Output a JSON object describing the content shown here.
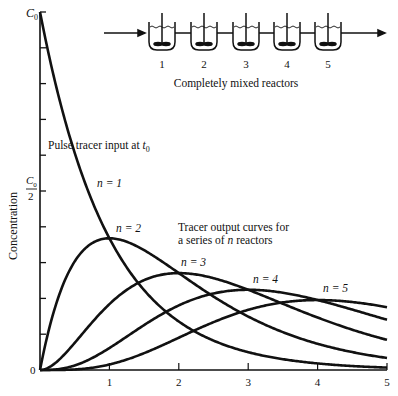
{
  "chart_data": {
    "type": "line",
    "title": "",
    "xlabel": "",
    "ylabel": "Concentration",
    "xlim": [
      0,
      5
    ],
    "ylim": [
      0,
      1
    ],
    "x_ticks": [
      "1",
      "2",
      "3",
      "4",
      "5"
    ],
    "x_origin_label": "0",
    "y_tick_labels": {
      "top": "C0",
      "middle": "C0/2",
      "origin": "0"
    },
    "y_minor_ticks": 10,
    "grid": false,
    "legend": null,
    "formula": "C/C0 = t^(n-1)/(n-1)! * exp(-t)",
    "series": [
      {
        "name": "n = 1",
        "n": 1,
        "peak": {
          "x": 0,
          "y": 1.0
        }
      },
      {
        "name": "n = 2",
        "n": 2,
        "peak": {
          "x": 1,
          "y": 0.368
        }
      },
      {
        "name": "n = 3",
        "n": 3,
        "peak": {
          "x": 2,
          "y": 0.271
        }
      },
      {
        "name": "n = 4",
        "n": 4,
        "peak": {
          "x": 3,
          "y": 0.224
        }
      },
      {
        "name": "n = 5",
        "n": 5,
        "peak": {
          "x": 4,
          "y": 0.195
        }
      }
    ],
    "annotations": [
      "Pulse tracer input at t0",
      "Tracer output curves for",
      "a series of n reactors"
    ]
  },
  "diagram": {
    "reactor_labels": [
      "1",
      "2",
      "3",
      "4",
      "5"
    ],
    "caption": "Completely mixed reactors"
  },
  "labels": {
    "pulse": "Pulse tracer input at ",
    "pulse_sub": "t",
    "pulse_sub_idx": "0",
    "output_line1": "Tracer output curves for",
    "output_line2_a": "a series of ",
    "output_line2_n": "n",
    "output_line2_b": " reactors",
    "n1": "n = 1",
    "n2": "n = 2",
    "n3": "n = 3",
    "n4": "n = 4",
    "n5": "n = 5",
    "y_axis": "Concentration",
    "c0": "C",
    "c0_sub": "0",
    "half": "2",
    "zero": "0"
  }
}
